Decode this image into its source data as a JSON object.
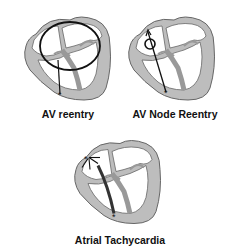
{
  "diagrams": [
    {
      "label": "AV reentry",
      "mechanism": "macro-reentrant circuit through accessory pathway",
      "origin_marker": "asterisk"
    },
    {
      "label": "AV Node Reentry",
      "mechanism": "small reentrant loop within AV node",
      "origin_marker": "asterisk"
    },
    {
      "label": "Atrial Tachycardia",
      "mechanism": "ectopic atrial focus with radiating arrows",
      "origin_marker": "asterisk"
    }
  ],
  "colors": {
    "heart_fill": "#bdbdbd",
    "outline": "#555555",
    "pathway": "#111111",
    "background": "#ffffff"
  }
}
